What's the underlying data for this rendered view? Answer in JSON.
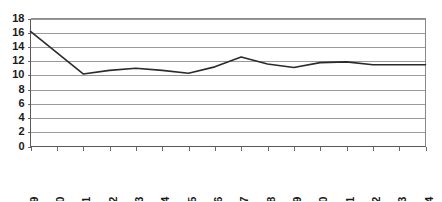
{
  "chart_data": {
    "type": "line",
    "title": "",
    "subtitle": "",
    "xlabel": "",
    "ylabel": "",
    "categories": [
      "1989",
      "1990",
      "1991",
      "1992",
      "1993",
      "1994",
      "1995",
      "1996",
      "1997",
      "1998",
      "1999",
      "2000",
      "2001",
      "2002",
      "2003",
      "2004"
    ],
    "series": [
      {
        "name": "series-1",
        "values": [
          16.2,
          13.2,
          10.2,
          10.7,
          11.0,
          10.7,
          10.3,
          11.2,
          12.6,
          11.6,
          11.1,
          11.8,
          11.9,
          11.5,
          11.5,
          11.5
        ]
      }
    ],
    "ylim": [
      0,
      18
    ],
    "ytick_step": 2,
    "yticks": [
      "0",
      "2",
      "4",
      "6",
      "8",
      "10",
      "12",
      "14",
      "16",
      "18"
    ],
    "xlim_labels": [
      "1989",
      "2004"
    ],
    "grid": "horizontal",
    "legend": "none",
    "line_color": "#2b2b2b",
    "gridline_color": "#9a9a9a",
    "axis_color": "#5a5a5a",
    "background_color": "#ffffff",
    "xtick_rotation_degrees": -90,
    "annotations": []
  },
  "axes": {
    "y_axis_name": "value-axis",
    "x_axis_name": "year-axis"
  }
}
